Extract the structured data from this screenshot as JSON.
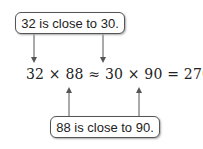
{
  "callouts": {
    "top": "32 is close to 30.",
    "bottom": "88 is close to 90."
  },
  "equation": "32 × 88 ≈ 30 × 90 = 2700"
}
